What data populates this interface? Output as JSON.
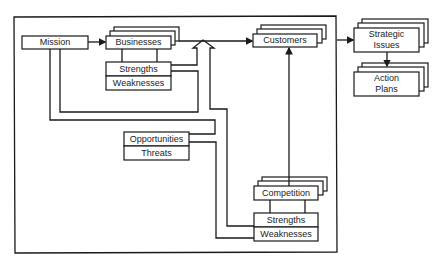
{
  "diagram": {
    "internal_analysis": {
      "mission": "Mission",
      "businesses": "Businesses",
      "business_strengths": "Strengths",
      "business_weaknesses": "Weaknesses"
    },
    "external_analysis": {
      "customers": "Customers",
      "opportunities": "Opportunities",
      "threats": "Threats",
      "competition": "Competition",
      "competition_strengths": "Strengths",
      "competition_weaknesses": "Weaknesses"
    },
    "outputs": {
      "strategic_issues_line1": "Strategic",
      "strategic_issues_line2": "Issues",
      "action_plans_line1": "Action",
      "action_plans_line2": "Plans"
    },
    "colors": {
      "line": "#1a1a1a",
      "background": "#ffffff",
      "text": "#222222"
    }
  }
}
